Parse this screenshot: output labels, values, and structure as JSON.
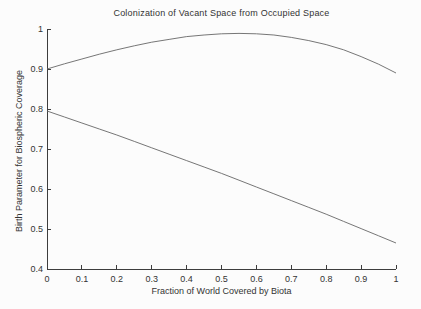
{
  "figure": {
    "background": "#fcfcfc"
  },
  "chart_data": {
    "type": "line",
    "title": "Colonization of Vacant Space from Occupied Space",
    "xlabel": "Fraction of World Covered by Biota",
    "ylabel": "Birth Parameter for Biospheric Coverage",
    "xlim": [
      0,
      1
    ],
    "ylim": [
      0.4,
      1
    ],
    "grid": false,
    "legend": "none",
    "axis_color": "#3d3d3d",
    "line_color": "#666666",
    "text_color": "#333333",
    "xticks": [
      0,
      0.1,
      0.2,
      0.3,
      0.4,
      0.5,
      0.6,
      0.7,
      0.8,
      0.9,
      1
    ],
    "xtick_labels": [
      "0",
      "0.1",
      "0.2",
      "0.3",
      "0.4",
      "0.5",
      "0.6",
      "0.7",
      "0.8",
      "0.9",
      "1"
    ],
    "yticks": [
      0.4,
      0.5,
      0.6,
      0.7,
      0.8,
      0.9,
      1
    ],
    "ytick_labels": [
      "0.4",
      "0.5",
      "0.6",
      "0.7",
      "0.8",
      "0.9",
      "1"
    ],
    "x": [
      0,
      0.05,
      0.1,
      0.15,
      0.2,
      0.25,
      0.3,
      0.35,
      0.4,
      0.45,
      0.5,
      0.55,
      0.6,
      0.65,
      0.7,
      0.75,
      0.8,
      0.85,
      0.9,
      0.95,
      1
    ],
    "series": [
      {
        "name": "upper",
        "description": "concave curve rising from 0.9 to a peak near 0.99 around x=0.55 then falling back to 0.89",
        "values": [
          0.9,
          0.913,
          0.925,
          0.937,
          0.948,
          0.958,
          0.967,
          0.974,
          0.981,
          0.985,
          0.988,
          0.989,
          0.988,
          0.985,
          0.979,
          0.971,
          0.961,
          0.948,
          0.931,
          0.912,
          0.89
        ]
      },
      {
        "name": "lower",
        "description": "near-linear gently steepening decline from 0.795 to 0.465",
        "values": [
          0.795,
          0.78,
          0.765,
          0.75,
          0.735,
          0.719,
          0.703,
          0.687,
          0.671,
          0.655,
          0.639,
          0.622,
          0.605,
          0.588,
          0.571,
          0.554,
          0.537,
          0.519,
          0.501,
          0.483,
          0.465
        ]
      }
    ]
  }
}
